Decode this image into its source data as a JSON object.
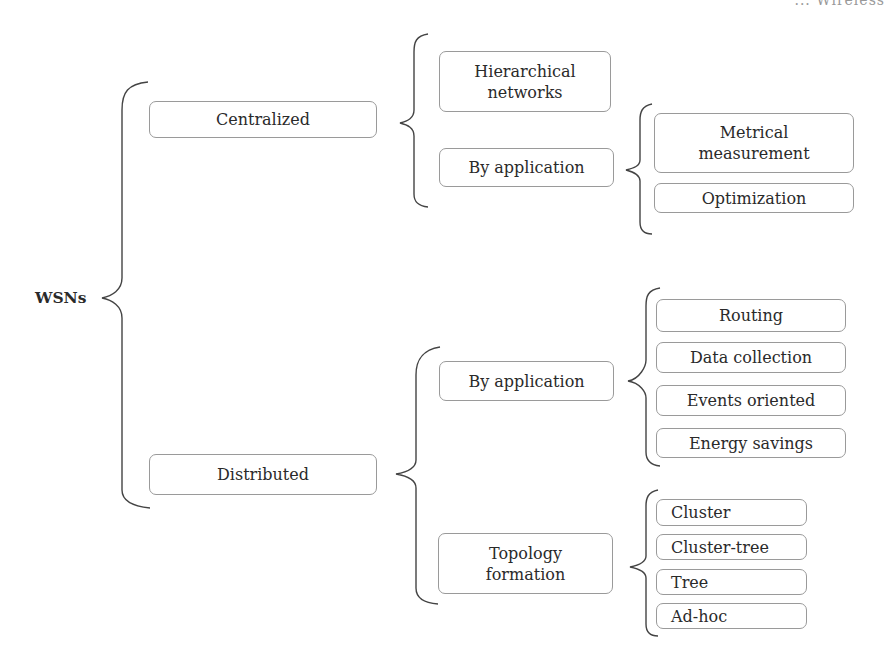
{
  "header_cropped_text": "... Wireless",
  "root": "WSNs",
  "level1": {
    "centralized": "Centralized",
    "distributed": "Distributed"
  },
  "centralized_children": {
    "hierarchical": "Hierarchical networks",
    "by_application": "By application"
  },
  "centralized_by_application_children": [
    "Metrical measurement",
    "Optimization"
  ],
  "distributed_children": {
    "by_application": "By application",
    "topology": "Topology formation"
  },
  "distributed_by_application_children": [
    "Routing",
    "Data collection",
    "Events oriented",
    "Energy savings"
  ],
  "topology_children": [
    "Cluster",
    "Cluster-tree",
    "Tree",
    "Ad-hoc"
  ],
  "colors": {
    "box_border": "#9a9a9a",
    "bracket": "#444444",
    "text": "#2a2a2a"
  }
}
